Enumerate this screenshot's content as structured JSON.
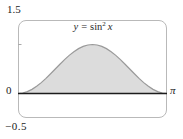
{
  "figure": {
    "labels": {
      "y_max_tick": "1.5",
      "y_min_tick": "−0.5",
      "origin_tick": "0",
      "x_max_tick": "π"
    },
    "curve_label": {
      "lhs": "y",
      "equals": "=",
      "function": "sin",
      "exponent": "2",
      "variable": "x"
    }
  },
  "chart_data": {
    "type": "area",
    "xlim": [
      0,
      3.14159265
    ],
    "ylim": [
      -0.5,
      1.5
    ],
    "x_tick_labels": [
      "0",
      "π"
    ],
    "y_tick_labels": [
      "−0.5",
      "1.5"
    ],
    "y_ticks": [
      1
    ],
    "shaded_region": "area under y = sin²x between x = 0 and x = π",
    "values": [
      0,
      0.0096,
      0.0381,
      0.0843,
      0.1464,
      0.2222,
      0.3087,
      0.4025,
      0.5,
      0.5975,
      0.6913,
      0.7778,
      0.8536,
      0.9157,
      0.9619,
      0.9904,
      1,
      0.9904,
      0.9619,
      0.9157,
      0.8536,
      0.7778,
      0.6913,
      0.5975,
      0.5,
      0.4025,
      0.3087,
      0.2222,
      0.1464,
      0.0843,
      0.0381,
      0.0096,
      0
    ],
    "colors": {
      "fill": "#dcdcdc",
      "curve": "#9a9a9a",
      "axis": "#1c1c1c",
      "frame": "#b9b9b9",
      "tick": "#aaaaaa",
      "text": "#1a1a1a"
    }
  }
}
